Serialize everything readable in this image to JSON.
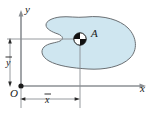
{
  "figure": {
    "axes": {
      "x_label": "x",
      "y_label": "y",
      "origin_label": "O"
    },
    "dimensions": {
      "x_bar_label": "x",
      "y_bar_label": "y",
      "overbar": true
    },
    "shape": {
      "area_label": "A",
      "fill_color": "#cfe6f0",
      "stroke_color": "#6a6f73",
      "description": "kidney-shaped planar region"
    },
    "centroid": {
      "marker": "quartered-circle",
      "fill_dark": "#111111",
      "fill_light": "#ffffff",
      "x": 80,
      "y": 39
    },
    "line_color": "#8b8f93",
    "text_color": "#1a1a1a"
  }
}
